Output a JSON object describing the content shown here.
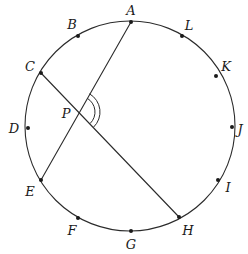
{
  "figure": {
    "width": 248,
    "height": 254,
    "background_color": "#ffffff",
    "stroke_color": "#2b2b2b",
    "dot_color": "#1a1a1a"
  },
  "circle": {
    "center_x": 130,
    "center_y": 126,
    "radius": 105,
    "stroke_width": 1.1
  },
  "points": [
    {
      "label": "A",
      "x": 131,
      "y": 22,
      "label_x": 131,
      "label_y": 10,
      "dot": true
    },
    {
      "label": "B",
      "x": 78,
      "y": 36,
      "label_x": 72,
      "label_y": 24,
      "dot": true
    },
    {
      "label": "C",
      "x": 41,
      "y": 73,
      "label_x": 30,
      "label_y": 66,
      "dot": true
    },
    {
      "label": "D",
      "x": 28,
      "y": 128,
      "label_x": 14,
      "label_y": 128,
      "dot": true
    },
    {
      "label": "E",
      "x": 41,
      "y": 180,
      "label_x": 30,
      "label_y": 191,
      "dot": true
    },
    {
      "label": "F",
      "x": 78,
      "y": 218,
      "label_x": 72,
      "label_y": 230,
      "dot": true
    },
    {
      "label": "G",
      "x": 131,
      "y": 231,
      "label_x": 131,
      "label_y": 244,
      "dot": true
    },
    {
      "label": "H",
      "x": 179,
      "y": 217,
      "label_x": 188,
      "label_y": 230,
      "dot": true
    },
    {
      "label": "I",
      "x": 218,
      "y": 180,
      "label_x": 228,
      "label_y": 187,
      "dot": true
    },
    {
      "label": "J",
      "x": 232,
      "y": 127,
      "label_x": 240,
      "label_y": 129,
      "dot": true
    },
    {
      "label": "K",
      "x": 216,
      "y": 76,
      "label_x": 226,
      "label_y": 66,
      "dot": true
    },
    {
      "label": "L",
      "x": 182,
      "y": 36,
      "label_x": 189,
      "label_y": 25,
      "dot": true
    }
  ],
  "intersection": {
    "label": "P",
    "x": 79,
    "y": 112,
    "label_x": 66,
    "label_y": 113,
    "dot": false
  },
  "chords": [
    {
      "name": "chord-A-E",
      "from": "A",
      "to": "E",
      "x1": 131,
      "y1": 22,
      "x2": 41,
      "y2": 180
    },
    {
      "name": "chord-C-H",
      "from": "C",
      "to": "H",
      "x1": 41,
      "y1": 73,
      "x2": 179,
      "y2": 217
    }
  ],
  "angle_marker": {
    "at": "P",
    "vertex_x": 79,
    "vertex_y": 112,
    "arc_count": 2,
    "arc_radii": [
      16,
      21
    ],
    "from_ray": "PA",
    "to_ray": "PH",
    "start_angle_deg": -60,
    "end_angle_deg": 46
  }
}
